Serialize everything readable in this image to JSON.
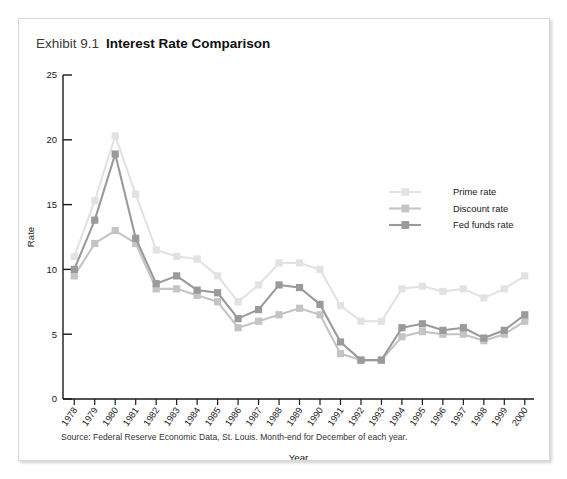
{
  "card": {
    "exhibit_label": "Exhibit 9.1",
    "title": "Interest Rate Comparison",
    "source_note": "Source: Federal Reserve Economic Data, St. Louis. Month-end for December of each year."
  },
  "colors": {
    "prime": "#e2e2e2",
    "discount": "#c4c4c4",
    "fed_funds": "#9a9a9a",
    "axis": "#1a1a1a",
    "card_border": "#d8d8d8",
    "title": "#111111"
  },
  "chart_data": {
    "type": "line",
    "title": "Interest Rate Comparison",
    "xlabel": "Year",
    "ylabel": "Rate",
    "ylim": [
      0,
      25
    ],
    "yticks": [
      0,
      5,
      10,
      15,
      20,
      25
    ],
    "grid": false,
    "legend_position": "upper-right-inside",
    "categories": [
      "1978",
      "1979",
      "1980",
      "1981",
      "1982",
      "1983",
      "1984",
      "1985",
      "1986",
      "1987",
      "1988",
      "1989",
      "1990",
      "1991",
      "1992",
      "1993",
      "1994",
      "1995",
      "1996",
      "1997",
      "1998",
      "1999",
      "2000"
    ],
    "series": [
      {
        "name": "Prime rate",
        "color": "#e2e2e2",
        "values": [
          11.0,
          15.3,
          20.3,
          15.8,
          11.5,
          11.0,
          10.8,
          9.5,
          7.5,
          8.8,
          10.5,
          10.5,
          10.0,
          7.2,
          6.0,
          6.0,
          8.5,
          8.7,
          8.3,
          8.5,
          7.8,
          8.5,
          9.5
        ]
      },
      {
        "name": "Discount rate",
        "color": "#c4c4c4",
        "values": [
          9.5,
          12.0,
          13.0,
          12.0,
          8.5,
          8.5,
          8.0,
          7.5,
          5.5,
          6.0,
          6.5,
          7.0,
          6.5,
          3.5,
          3.0,
          3.0,
          4.8,
          5.2,
          5.0,
          5.0,
          4.5,
          5.0,
          6.0
        ]
      },
      {
        "name": "Fed funds rate",
        "color": "#9a9a9a",
        "values": [
          10.0,
          13.8,
          18.9,
          12.4,
          8.9,
          9.5,
          8.4,
          8.2,
          6.2,
          6.9,
          8.8,
          8.6,
          7.3,
          4.4,
          3.0,
          3.0,
          5.5,
          5.8,
          5.3,
          5.5,
          4.7,
          5.3,
          6.5
        ]
      }
    ]
  }
}
